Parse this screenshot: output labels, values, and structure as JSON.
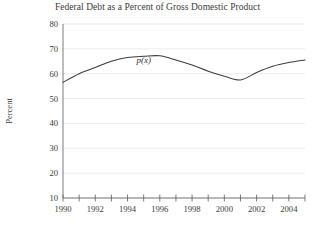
{
  "chart_data": {
    "type": "line",
    "title": "Federal Debt as a Percent of Gross Domestic Product",
    "xlabel": "",
    "ylabel": "Percent",
    "xlim": [
      1990,
      2005
    ],
    "ylim": [
      10,
      80
    ],
    "grid": true,
    "grid_axis": "y",
    "legend": "none",
    "series_label": "p(x)",
    "series_label_position": {
      "x": 1995,
      "y": 64.5
    },
    "x": [
      1990,
      1991,
      1992,
      1993,
      1994,
      1995,
      1996,
      1997,
      1998,
      1999,
      2000,
      2001,
      2002,
      2003,
      2004,
      2005
    ],
    "values": [
      56.5,
      60.0,
      62.5,
      65.0,
      66.5,
      67.0,
      67.2,
      65.5,
      63.5,
      61.0,
      59.0,
      57.5,
      60.5,
      63.0,
      64.5,
      65.5
    ],
    "series": [
      {
        "name": "p(x)",
        "values": [
          56.5,
          60.0,
          62.5,
          65.0,
          66.5,
          67.0,
          67.2,
          65.5,
          63.5,
          61.0,
          59.0,
          57.5,
          60.5,
          63.0,
          64.5,
          65.5
        ]
      }
    ],
    "yticks": [
      10,
      20,
      30,
      40,
      50,
      60,
      70,
      80
    ],
    "ytick_labels": [
      "10",
      "20",
      "30",
      "40",
      "50",
      "60",
      "70",
      "80"
    ],
    "xticks": [
      1990,
      1991,
      1992,
      1993,
      1994,
      1995,
      1996,
      1997,
      1998,
      1999,
      2000,
      2001,
      2002,
      2003,
      2004,
      2005
    ],
    "xtick_labels": [
      "1990",
      "",
      "1992",
      "",
      "1994",
      "",
      "1996",
      "",
      "1998",
      "",
      "2000",
      "",
      "2002",
      "",
      "2004",
      ""
    ],
    "xtick_labels_shown": [
      "1990",
      "1992",
      "1994",
      "1996",
      "1998",
      "2000",
      "2002",
      "2004"
    ],
    "colors": {
      "line": "#3c3c3c",
      "axis": "#5a5a5a",
      "grid": "#ececec",
      "text": "#3a3a3a",
      "background": "#ffffff"
    }
  }
}
